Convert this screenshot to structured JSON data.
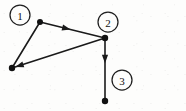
{
  "figure": {
    "background_color": "#fdfdfc",
    "ink_color": "#111111",
    "width": 186,
    "height": 111
  },
  "chart_data": {
    "type": "diagram",
    "subtype": "directed-graph",
    "nodes": [
      {
        "id": "top",
        "x": 40,
        "y": 22,
        "radius": 3.0
      },
      {
        "id": "bottom_left",
        "x": 12,
        "y": 68,
        "radius": 3.2
      },
      {
        "id": "right",
        "x": 105,
        "y": 38,
        "radius": 3.2
      },
      {
        "id": "bottom",
        "x": 105,
        "y": 101,
        "radius": 3.2
      }
    ],
    "edges": [
      {
        "id": "e1",
        "from": "top",
        "to": "right",
        "directed": true,
        "arrow_at": "mid",
        "arrow_t": 0.47
      },
      {
        "id": "e2",
        "from": "right",
        "to": "bottom_left",
        "directed": true,
        "arrow_at": "end",
        "arrow_t": 1.0
      },
      {
        "id": "e3",
        "from": "right",
        "to": "bottom",
        "directed": true,
        "arrow_at": "mid",
        "arrow_t": 0.4
      },
      {
        "id": "e4",
        "from": "bottom_left",
        "to": "top",
        "directed": false,
        "arrow_at": "none",
        "arrow_t": 0
      }
    ],
    "callouts": [
      {
        "id": "c1",
        "label": "1",
        "cx": 20,
        "cy": 15,
        "r": 10
      },
      {
        "id": "c2",
        "label": "2",
        "cx": 108,
        "cy": 22,
        "r": 10
      },
      {
        "id": "c3",
        "label": "3",
        "cx": 122,
        "cy": 80,
        "r": 10
      }
    ],
    "legend": [],
    "xlabel": "",
    "ylabel": "",
    "grid": false
  }
}
